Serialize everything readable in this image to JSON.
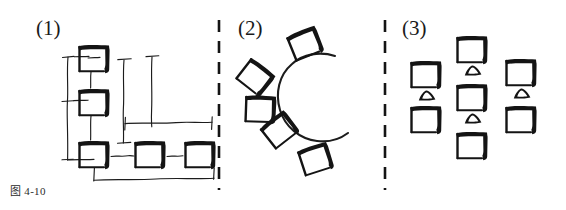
{
  "figure": {
    "caption": "图 4-10",
    "background_color": "#ffffff",
    "ink_color": "#141414",
    "width": 566,
    "height": 210
  },
  "panels": [
    {
      "label": "(1)",
      "label_x": 36,
      "label_y": 16,
      "name": "l-shaped-desk-layout",
      "desk_count": 5,
      "chair_count": 0
    },
    {
      "label": "(2)",
      "label_x": 238,
      "label_y": 16,
      "name": "arc-desk-layout",
      "desk_count": 5,
      "chair_count": 0
    },
    {
      "label": "(3)",
      "label_x": 402,
      "label_y": 16,
      "name": "grid-desk-layout",
      "desk_count": 7,
      "chair_count": 4
    }
  ],
  "dividers": [
    {
      "name": "divider-1-2",
      "x": 219,
      "y1": 20,
      "y2": 190
    },
    {
      "name": "divider-2-3",
      "x": 385,
      "y1": 20,
      "y2": 190
    }
  ],
  "panel1": {
    "desks": [
      {
        "name": "desk-p1-top",
        "x": 78,
        "y": 44,
        "w": 32,
        "h": 28
      },
      {
        "name": "desk-p1-middle",
        "x": 78,
        "y": 88,
        "w": 32,
        "h": 28
      },
      {
        "name": "desk-p1-bottom-left",
        "x": 78,
        "y": 140,
        "w": 32,
        "h": 28
      },
      {
        "name": "desk-p1-bottom-mid",
        "x": 134,
        "y": 140,
        "w": 32,
        "h": 28
      },
      {
        "name": "desk-p1-bottom-right",
        "x": 184,
        "y": 140,
        "w": 32,
        "h": 28
      }
    ],
    "dimension_lines": [
      {
        "name": "dim-vertical-left",
        "orientation": "vertical"
      },
      {
        "name": "dim-vertical-inner",
        "orientation": "vertical"
      },
      {
        "name": "dim-horizontal-mid",
        "orientation": "horizontal"
      },
      {
        "name": "dim-horizontal-bottom",
        "orientation": "horizontal"
      }
    ]
  },
  "panel2": {
    "arc": {
      "name": "c-shaped-curve",
      "cx": 312,
      "cy": 100,
      "r": 40,
      "opening": "right"
    },
    "desks": [
      {
        "name": "desk-p2-1",
        "x": 285,
        "y": 36,
        "rot": -22
      },
      {
        "name": "desk-p2-2",
        "x": 252,
        "y": 56,
        "rot": 38
      },
      {
        "name": "desk-p2-3",
        "x": 245,
        "y": 94,
        "rot": 2
      },
      {
        "name": "desk-p2-4",
        "x": 258,
        "y": 128,
        "rot": -38
      },
      {
        "name": "desk-p2-5",
        "x": 296,
        "y": 150,
        "rot": -18
      }
    ]
  },
  "panel3": {
    "columns": [
      {
        "name": "column-left",
        "desks": [
          {
            "name": "desk-p3-l1",
            "x": 410,
            "y": 60
          },
          {
            "name": "desk-p3-l2",
            "x": 410,
            "y": 105
          }
        ],
        "chairs": [
          {
            "name": "chair-p3-l1",
            "x": 418,
            "y": 90
          }
        ]
      },
      {
        "name": "column-middle",
        "desks": [
          {
            "name": "desk-p3-m1",
            "x": 456,
            "y": 35
          },
          {
            "name": "desk-p3-m2",
            "x": 456,
            "y": 83
          },
          {
            "name": "desk-p3-m3",
            "x": 456,
            "y": 131
          }
        ],
        "chairs": [
          {
            "name": "chair-p3-m1",
            "x": 464,
            "y": 65
          },
          {
            "name": "chair-p3-m2",
            "x": 464,
            "y": 113
          }
        ]
      },
      {
        "name": "column-right",
        "desks": [
          {
            "name": "desk-p3-r1",
            "x": 505,
            "y": 58
          },
          {
            "name": "desk-p3-r2",
            "x": 505,
            "y": 105
          }
        ],
        "chairs": [
          {
            "name": "chair-p3-r1",
            "x": 513,
            "y": 88
          }
        ]
      }
    ]
  }
}
